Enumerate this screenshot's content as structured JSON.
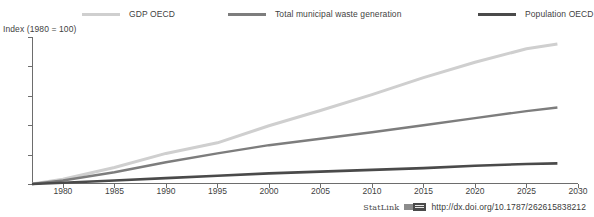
{
  "legend": {
    "position": "top",
    "items": [
      {
        "label": "GDP OECD",
        "color": "#cfcfcf"
      },
      {
        "label": "Total municipal waste generation",
        "color": "#7d7d7d"
      },
      {
        "label": "Population OECD",
        "color": "#4a4a4a"
      }
    ]
  },
  "axis_title": "Index (1980 = 100)",
  "footer": {
    "statlink_word": "StatLink",
    "statlink_glyph": "statlink-icon",
    "url": "http://dx.doi.org/10.1787/262615838212"
  },
  "chart_data": {
    "type": "line",
    "title": "",
    "subtitle": "",
    "xlabel": "",
    "ylabel": "Index (1980 = 100)",
    "xlim": [
      1977,
      2030
    ],
    "ylim": [
      100,
      350
    ],
    "xticks": [
      1980,
      1985,
      1990,
      1995,
      2000,
      2005,
      2010,
      2015,
      2020,
      2025,
      2030
    ],
    "yticks": [
      100,
      150,
      200,
      250,
      300,
      350
    ],
    "xtick_labels": [
      "1980",
      "1985",
      "1990",
      "1995",
      "2000",
      "2005",
      "2010",
      "2015",
      "2020",
      "2025",
      "2030"
    ],
    "ytick_labels": [
      "100",
      "150",
      "200",
      "250",
      "300",
      "350"
    ],
    "grid": false,
    "legend_position": "top",
    "x": [
      1977,
      1980,
      1985,
      1990,
      1995,
      2000,
      2005,
      2010,
      2015,
      2020,
      2025,
      2028
    ],
    "series": [
      {
        "name": "GDP OECD",
        "color": "#cfcfcf",
        "width": 3,
        "values": [
          100,
          108,
          128,
          152,
          170,
          199,
          225,
          252,
          281,
          307,
          330,
          338
        ]
      },
      {
        "name": "Total municipal waste generation",
        "color": "#7d7d7d",
        "width": 2.4,
        "values": [
          100,
          106,
          120,
          137,
          152,
          166,
          177,
          188,
          200,
          212,
          224,
          230
        ]
      },
      {
        "name": "Population OECD",
        "color": "#4a4a4a",
        "width": 2.6,
        "values": [
          100,
          102,
          106,
          110,
          114,
          118,
          121,
          124,
          127,
          131,
          134,
          135
        ]
      }
    ]
  }
}
